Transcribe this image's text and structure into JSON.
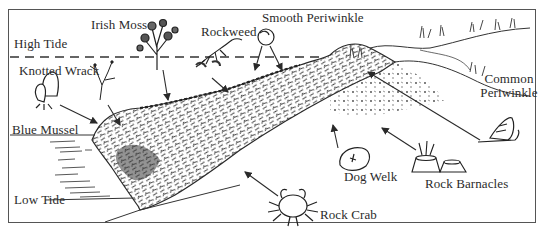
{
  "figure": {
    "zones": {
      "high_tide": "High Tide",
      "low_tide": "Low Tide"
    },
    "organisms": [
      {
        "id": "irish-moss",
        "label": "Irish Moss"
      },
      {
        "id": "rockweed",
        "label": "Rockweed"
      },
      {
        "id": "smooth-periwinkle",
        "label": "Smooth Periwinkle"
      },
      {
        "id": "knotted-wrack",
        "label": "Knotted Wrack"
      },
      {
        "id": "blue-mussel",
        "label": "Blue Mussel"
      },
      {
        "id": "common-periwinkle",
        "label_line1": "Common",
        "label_line2": "Periwinkle"
      },
      {
        "id": "dog-welk",
        "label": "Dog Welk"
      },
      {
        "id": "rock-barnacles",
        "label": "Rock Barnacles"
      },
      {
        "id": "rock-crab",
        "label": "Rock Crab"
      }
    ],
    "colors": {
      "ink": "#2a2a2a",
      "frame": "#555555",
      "background": "#ffffff"
    }
  }
}
